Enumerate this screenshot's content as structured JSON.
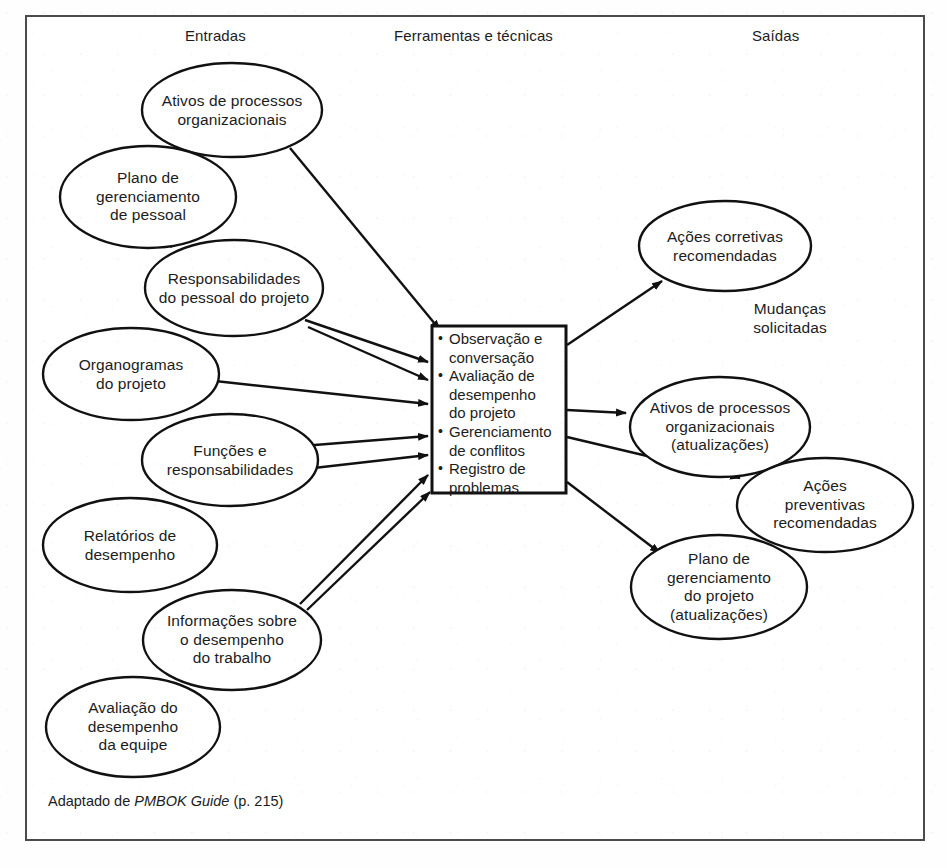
{
  "figure": {
    "frame_color": "#4b4b4b",
    "line_color": "#111111",
    "background": "#ffffff"
  },
  "headers": {
    "inputs": "Entradas",
    "tools": "Ferramentas e técnicas",
    "outputs": "Saídas"
  },
  "inputs": [
    {
      "id": "ativos-processos-organizacionais",
      "label": "Ativos de processos\norganizacionais",
      "cx": 232,
      "cy": 110,
      "rx": 90,
      "ry": 47
    },
    {
      "id": "plano-gerenciamento-pessoal",
      "label": "Plano de\ngerenciamento\nde pessoal",
      "cx": 148,
      "cy": 197,
      "rx": 88,
      "ry": 51
    },
    {
      "id": "responsabilidades-pessoal-projeto",
      "label": "Responsabilidades\ndo pessoal do projeto",
      "cx": 234,
      "cy": 288,
      "rx": 89,
      "ry": 48
    },
    {
      "id": "organogramas-projeto",
      "label": "Organogramas\ndo projeto",
      "cx": 131,
      "cy": 374,
      "rx": 88,
      "ry": 46
    },
    {
      "id": "funcoes-responsabilidades",
      "label": "Funções e\nresponsabilidades",
      "cx": 230,
      "cy": 460,
      "rx": 88,
      "ry": 46
    },
    {
      "id": "relatorios-desempenho",
      "label": "Relatórios de\ndesempenho",
      "cx": 130,
      "cy": 545,
      "rx": 87,
      "ry": 47
    },
    {
      "id": "informacoes-desempenho-trabalho",
      "label": "Informações sobre\no desempenho\ndo trabalho",
      "cx": 232,
      "cy": 640,
      "rx": 89,
      "ry": 50
    },
    {
      "id": "avaliacao-desempenho-equipe",
      "label": "Avaliação do\ndesempenho\nda equipe",
      "cx": 133,
      "cy": 727,
      "rx": 87,
      "ry": 50
    }
  ],
  "center_box": {
    "id": "ferramentas-tecnicas-box",
    "x": 432,
    "y": 326,
    "width": 134,
    "height": 167,
    "items": [
      "Observação e\nconversação",
      "Avaliação de\ndesempenho\ndo projeto",
      "Gerenciamento\nde conflitos",
      "Registro de\nproblemas"
    ]
  },
  "outputs": [
    {
      "id": "acoes-corretivas-recomendadas",
      "label": "Ações corretivas\nrecomendadas",
      "cx": 725,
      "cy": 246,
      "rx": 86,
      "ry": 45
    },
    {
      "id": "ativos-processos-organizacionais-atualizacoes",
      "label": "Ativos de processos\norganizacionais\n(atualizações)",
      "cx": 720,
      "cy": 427,
      "rx": 90,
      "ry": 50
    },
    {
      "id": "acoes-preventivas-recomendadas",
      "label": "Ações preventivas\nrecomendadas",
      "cx": 825,
      "cy": 505,
      "rx": 88,
      "ry": 47
    },
    {
      "id": "plano-gerenciamento-projeto-atualizacoes",
      "label": "Plano de\ngerenciamento\ndo projeto\n(atualizações)",
      "cx": 719,
      "cy": 587,
      "rx": 88,
      "ry": 52
    }
  ],
  "free_labels": [
    {
      "id": "mudancas-solicitadas",
      "label": "Mudanças\nsolicitadas",
      "cx": 790,
      "cy": 318
    }
  ],
  "input_arrows": [
    {
      "from": "ativos-processos-organizacionais",
      "x1": 290,
      "y1": 148,
      "x2": 440,
      "y2": 330
    },
    {
      "from": "responsabilidades-pessoal-projeto",
      "x1": 305,
      "y1": 320,
      "x2": 428,
      "y2": 362
    },
    {
      "from": "responsabilidades-pessoal-projeto",
      "x1": 308,
      "y1": 327,
      "x2": 428,
      "y2": 380
    },
    {
      "from": "organogramas-projeto",
      "x1": 215,
      "y1": 381,
      "x2": 428,
      "y2": 404
    },
    {
      "from": "funcoes-responsabilidades",
      "x1": 302,
      "y1": 446,
      "x2": 428,
      "y2": 436
    },
    {
      "from": "funcoes-responsabilidades",
      "x1": 305,
      "y1": 469,
      "x2": 428,
      "y2": 455
    },
    {
      "from": "informacoes-desempenho-trabalho",
      "x1": 300,
      "y1": 604,
      "x2": 428,
      "y2": 475
    },
    {
      "from": "informacoes-desempenho-trabalho",
      "x1": 307,
      "y1": 610,
      "x2": 430,
      "y2": 492
    }
  ],
  "output_arrows": [
    {
      "to": "acoes-corretivas-recomendadas",
      "x1": 567,
      "y1": 345,
      "x2": 662,
      "y2": 281
    },
    {
      "to": "ativos-processos-organizacionais-atualizacoes",
      "x1": 567,
      "y1": 410,
      "x2": 626,
      "y2": 413
    },
    {
      "to": "acoes-preventivas-recomendadas",
      "x1": 567,
      "y1": 437,
      "x2": 740,
      "y2": 478
    },
    {
      "to": "plano-gerenciamento-projeto-atualizacoes",
      "x1": 567,
      "y1": 482,
      "x2": 660,
      "y2": 553
    }
  ],
  "connector_lines": [
    {
      "from": "plano-gerenciamento-pessoal",
      "to": "responsabilidades-pessoal-projeto",
      "x1": 206,
      "y1": 233,
      "x2": 170,
      "y2": 247
    },
    {
      "from": "funcoes-responsabilidades",
      "to": "relatorios-desempenho",
      "x1": 180,
      "y1": 497,
      "x2": 215,
      "y2": 480
    },
    {
      "from": "informacoes-desempenho-trabalho",
      "to": "avaliacao-desempenho-equipe",
      "x1": 180,
      "y1": 677,
      "x2": 207,
      "y2": 665
    }
  ],
  "caption": {
    "prefix": "Adaptado de ",
    "italic": "PMBOK Guide",
    "suffix": " (p. 215)"
  }
}
